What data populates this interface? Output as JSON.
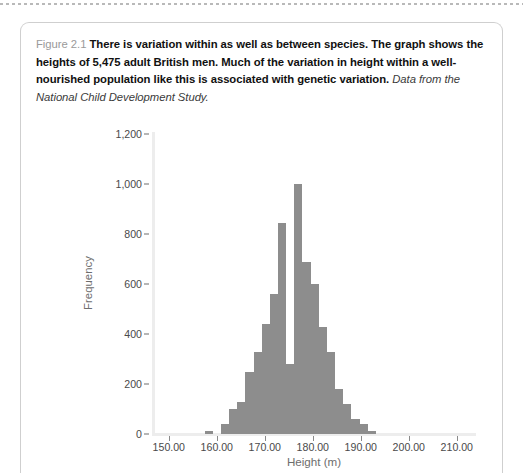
{
  "figure": {
    "label": "Figure 2.1",
    "main_text": "There is variation within as well as between species. The graph shows the heights of 5,475 adult British men. Much of the variation in height within a well-nourished population like this is associated with genetic variation.",
    "source_text": "Data from the National Child Development Study."
  },
  "chart_data": {
    "type": "bar",
    "title": "",
    "xlabel": "Height (m)",
    "ylabel": "Frequency",
    "xlim": [
      146.5,
      214.0
    ],
    "ylim": [
      0,
      1200
    ],
    "grid": false,
    "legend": null,
    "bar_color": "#8d8d8d",
    "y_ticks": [
      0,
      200,
      400,
      600,
      800,
      1000,
      1200
    ],
    "y_tick_labels": [
      "0",
      "200",
      "400",
      "600",
      "800",
      "1,000",
      "1,200"
    ],
    "x_ticks": [
      150,
      160,
      170,
      180,
      190,
      200,
      210
    ],
    "x_tick_labels": [
      "150.00",
      "160.00",
      "170.00",
      "180.00",
      "190.00",
      "200.00",
      "210.00"
    ],
    "bin_width": 1.7,
    "categories": [
      "158.3",
      "160.0",
      "161.7",
      "163.4",
      "165.1",
      "166.8",
      "168.5",
      "170.2",
      "171.9",
      "173.6",
      "175.3",
      "177.0",
      "178.7",
      "180.4",
      "182.1",
      "183.8",
      "185.5",
      "187.2",
      "188.9",
      "190.6",
      "192.3"
    ],
    "values": [
      12,
      0,
      40,
      100,
      130,
      250,
      330,
      440,
      560,
      845,
      280,
      1000,
      690,
      600,
      430,
      330,
      180,
      120,
      60,
      40,
      12
    ],
    "annotations": [
      "Total sample size: 5,475 adult British men"
    ]
  }
}
